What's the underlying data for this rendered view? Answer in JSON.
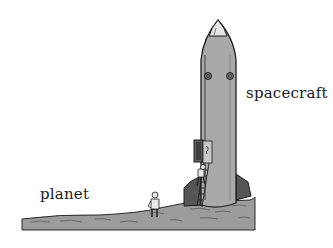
{
  "labels": {
    "planet": "planet",
    "spacecraft": "spacecraft"
  },
  "colors": {
    "rocket_body": "#a9a9a9",
    "rocket_shadow": "#7a7a7a",
    "fin_dark": "#555555",
    "nose_tip": "#e6e6e6",
    "ground": "#9c9c9c",
    "ground_shade": "#7d7d7d",
    "outline": "#1e1e1e",
    "hatch": "#5e5e5e"
  }
}
